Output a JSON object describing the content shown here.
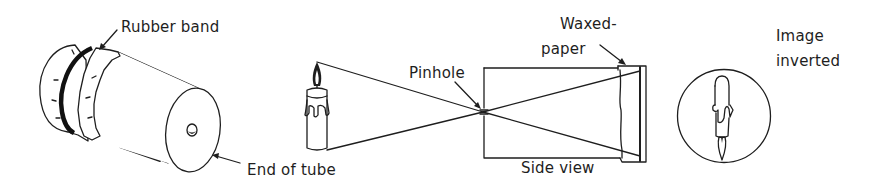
{
  "figure": {
    "type": "pinhole camera illustration",
    "panels": [
      {
        "id": "tube",
        "description": "Cardboard tube with waxed paper held by rubber band",
        "labels": {
          "rubber_band": "Rubber band",
          "end_of_tube": "End of tube"
        }
      },
      {
        "id": "side-view",
        "description": "Side view of light rays from candle passing through pinhole onto waxed paper",
        "labels": {
          "pinhole": "Pinhole",
          "waxed_paper_line1": "Waxed-",
          "waxed_paper_line2": "paper",
          "side_view": "Side view"
        }
      },
      {
        "id": "image",
        "description": "Inverted candle image seen on waxed paper",
        "labels": {
          "image_line1": "Image",
          "image_line2": "inverted"
        }
      }
    ]
  },
  "colors": {
    "ink": "#1e1e1e",
    "background": "#ffffff"
  }
}
